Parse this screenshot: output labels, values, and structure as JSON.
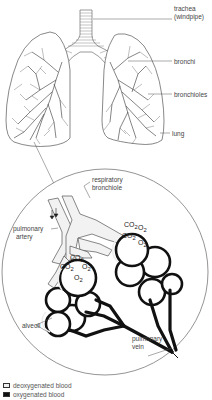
{
  "diagram": {
    "labels": {
      "trachea": "trachea",
      "trachea_alt": "(windpipe)",
      "bronchi": "bronchi",
      "bronchioles": "bronchioles",
      "lung": "lung",
      "respiratory_bronchiole_1": "respiratory",
      "respiratory_bronchiole_2": "bronchiole",
      "pulmonary_artery_1": "pulmonary",
      "pulmonary_artery_2": "artery",
      "alveoli": "alveoli",
      "pulmonary_vein_1": "pulmonary",
      "pulmonary_vein_2": "vein"
    },
    "gas_labels": {
      "co2": "CO",
      "o2": "O",
      "sub": "2"
    },
    "legend": [
      {
        "label": "deoxygenated blood",
        "color": "#f0f0f0"
      },
      {
        "label": "oxygenated blood",
        "color": "#111111"
      }
    ],
    "colors": {
      "line": "#444444",
      "oxygenated": "#111111",
      "deoxygenated": "#eeeeee",
      "airway": "#f4f4f4"
    }
  }
}
